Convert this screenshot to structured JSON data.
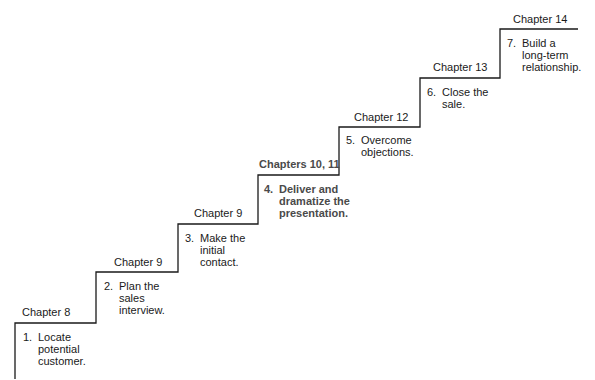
{
  "diagram": {
    "type": "staircase",
    "line_color": "#1a1a1a",
    "steps": [
      {
        "chapter": "Chapter 8",
        "number": "1.",
        "text": "Locate\npotential\ncustomer.",
        "emphasis": false
      },
      {
        "chapter": "Chapter 9",
        "number": "2.",
        "text": "Plan the\nsales\ninterview.",
        "emphasis": false
      },
      {
        "chapter": "Chapter 9",
        "number": "3.",
        "text": "Make the\ninitial\ncontact.",
        "emphasis": false
      },
      {
        "chapter": "Chapters 10, 11",
        "number": "4.",
        "text": "Deliver and\ndramatize the\npresentation.",
        "emphasis": true
      },
      {
        "chapter": "Chapter 12",
        "number": "5.",
        "text": "Overcome\nobjections.",
        "emphasis": false
      },
      {
        "chapter": "Chapter 13",
        "number": "6.",
        "text": "Close the\nsale.",
        "emphasis": false
      },
      {
        "chapter": "Chapter 14",
        "number": "7.",
        "text": "Build a\nlong-term\nrelationship.",
        "emphasis": false
      }
    ]
  }
}
